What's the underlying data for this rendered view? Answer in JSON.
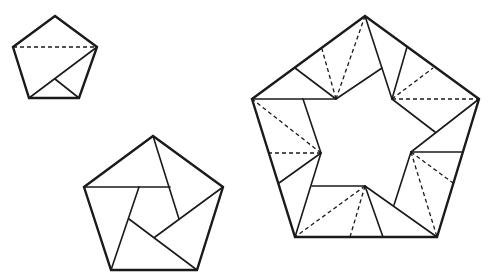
{
  "diagram": {
    "colors": {
      "stroke": "#1a1a1a",
      "background": "#ffffff"
    },
    "figures": [
      {
        "name": "step-1-small-pentagon",
        "outline": [
          [
            55,
            16
          ],
          [
            97,
            47
          ],
          [
            79,
            98
          ],
          [
            29,
            98
          ],
          [
            13,
            47
          ]
        ],
        "solid_lines": [
          [
            [
              97,
              47
            ],
            [
              29,
              98
            ]
          ],
          [
            [
              55,
              79
            ],
            [
              79,
              98
            ]
          ]
        ],
        "dashed_lines": [
          [
            [
              13,
              47
            ],
            [
              97,
              47
            ]
          ]
        ]
      },
      {
        "name": "step-2-pinwheel-pentagon",
        "outline": [
          [
            153,
            136
          ],
          [
            223,
            187
          ],
          [
            197,
            270
          ],
          [
            111,
            270
          ],
          [
            84,
            187
          ]
        ],
        "solid_lines": [
          [
            [
              84,
              187
            ],
            [
              170,
              187
            ]
          ],
          [
            [
              153,
              136
            ],
            [
              179,
              219
            ]
          ],
          [
            [
              223,
              187
            ],
            [
              155,
              237
            ]
          ],
          [
            [
              197,
              270
            ],
            [
              129,
              219
            ]
          ],
          [
            [
              111,
              270
            ],
            [
              139,
              187
            ]
          ]
        ],
        "dashed_lines": []
      },
      {
        "name": "step-3-star-pentagon",
        "outline": [
          [
            365,
            16
          ],
          [
            479,
            99
          ],
          [
            437,
            237
          ],
          [
            295,
            237
          ],
          [
            252,
            99
          ]
        ],
        "solid_lines": [
          [
            [
              252,
              99
            ],
            [
              336,
              99
            ]
          ],
          [
            [
              295,
              68
            ],
            [
              336,
              99
            ]
          ],
          [
            [
              336,
              99
            ],
            [
              382,
              68
            ]
          ],
          [
            [
              365,
              16
            ],
            [
              392,
              99
            ]
          ],
          [
            [
              392,
              99
            ],
            [
              407,
              47
            ]
          ],
          [
            [
              392,
              99
            ],
            [
              435,
              132
            ]
          ],
          [
            [
              479,
              99
            ],
            [
              411,
              152
            ]
          ],
          [
            [
              411,
              152
            ],
            [
              463,
              152
            ]
          ],
          [
            [
              411,
              152
            ],
            [
              394,
              205
            ]
          ],
          [
            [
              437,
              237
            ],
            [
              365,
              186
            ]
          ],
          [
            [
              365,
              186
            ],
            [
              383,
              237
            ]
          ],
          [
            [
              365,
              186
            ],
            [
              312,
              186
            ]
          ],
          [
            [
              295,
              237
            ],
            [
              321,
              153
            ]
          ],
          [
            [
              321,
              153
            ],
            [
              279,
              183
            ]
          ],
          [
            [
              321,
              153
            ],
            [
              303,
              99
            ]
          ]
        ],
        "dashed_lines": [
          [
            [
              336,
              99
            ],
            [
              322,
              49
            ]
          ],
          [
            [
              336,
              99
            ],
            [
              365,
              16
            ]
          ],
          [
            [
              392,
              99
            ],
            [
              433,
              68
            ]
          ],
          [
            [
              392,
              99
            ],
            [
              479,
              99
            ]
          ],
          [
            [
              411,
              152
            ],
            [
              453,
              183
            ]
          ],
          [
            [
              411,
              152
            ],
            [
              437,
              237
            ]
          ],
          [
            [
              365,
              186
            ],
            [
              350,
              237
            ]
          ],
          [
            [
              365,
              186
            ],
            [
              295,
              237
            ]
          ],
          [
            [
              321,
              153
            ],
            [
              268,
              153
            ]
          ],
          [
            [
              321,
              153
            ],
            [
              252,
              99
            ]
          ]
        ]
      }
    ]
  }
}
